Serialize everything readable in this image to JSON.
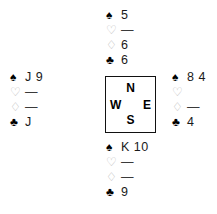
{
  "diagram": {
    "type": "bridge-deal-diagram",
    "suit_symbols": {
      "spade": "♠",
      "heart": "♡",
      "diamond": "♢",
      "club": "♣"
    },
    "void_marker": "—",
    "colors": {
      "background": "#ffffff",
      "major_suit_black": "#000000",
      "red_suit_outline": "#b9b9b9",
      "card_text": "#1a1a1a",
      "box_border": "#111111"
    }
  },
  "compass": {
    "north": "N",
    "west": "W",
    "east": "E",
    "south": "S"
  },
  "hands": {
    "north": {
      "position": "North",
      "rows": [
        {
          "suit": "spade",
          "symbol": "♠",
          "cards": "5",
          "void": false
        },
        {
          "suit": "heart",
          "symbol": "♡",
          "cards": "—",
          "void": true
        },
        {
          "suit": "diamond",
          "symbol": "♢",
          "cards": "6",
          "void": false
        },
        {
          "suit": "club",
          "symbol": "♣",
          "cards": "6",
          "void": false
        }
      ]
    },
    "west": {
      "position": "West",
      "rows": [
        {
          "suit": "spade",
          "symbol": "♠",
          "cards": "J 9",
          "void": false
        },
        {
          "suit": "heart",
          "symbol": "♡",
          "cards": "—",
          "void": true
        },
        {
          "suit": "diamond",
          "symbol": "♢",
          "cards": "—",
          "void": true
        },
        {
          "suit": "club",
          "symbol": "♣",
          "cards": "J",
          "void": false
        }
      ]
    },
    "east": {
      "position": "East",
      "rows": [
        {
          "suit": "spade",
          "symbol": "♠",
          "cards": "8 4",
          "void": false
        },
        {
          "suit": "heart",
          "symbol": "♡",
          "cards": "",
          "void": true
        },
        {
          "suit": "diamond",
          "symbol": "♢",
          "cards": "—",
          "void": true
        },
        {
          "suit": "club",
          "symbol": "♣",
          "cards": "4",
          "void": false
        }
      ]
    },
    "south": {
      "position": "South",
      "rows": [
        {
          "suit": "spade",
          "symbol": "♠",
          "cards": "K 10",
          "void": false
        },
        {
          "suit": "heart",
          "symbol": "♡",
          "cards": "—",
          "void": true
        },
        {
          "suit": "diamond",
          "symbol": "♢",
          "cards": "—",
          "void": true
        },
        {
          "suit": "club",
          "symbol": "♣",
          "cards": "9",
          "void": false
        }
      ]
    }
  }
}
